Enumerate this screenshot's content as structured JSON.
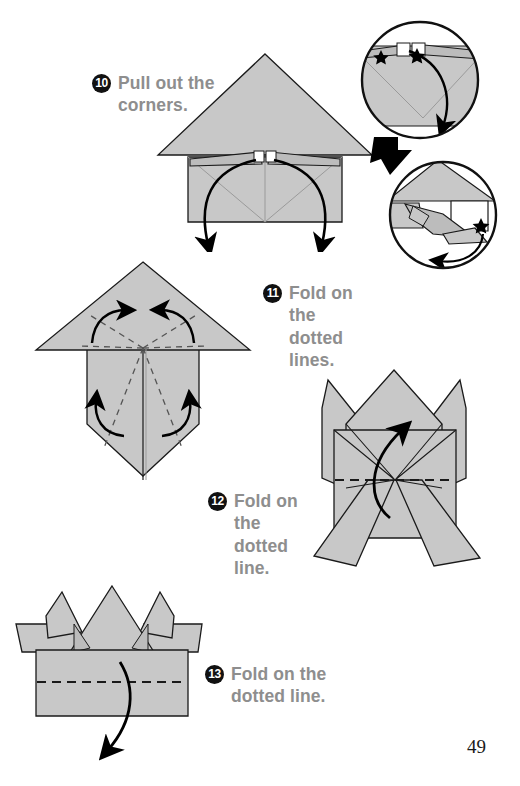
{
  "page": {
    "number": "49",
    "background_color": "#ffffff",
    "paper_fill": "#c8c8c8",
    "paper_fill_shade": "#bcbcbc",
    "outline_color": "#1a1a1a",
    "text_color": "#8e8e8e",
    "badge_color": "#111111",
    "arrow_color": "#000000"
  },
  "steps": [
    {
      "number": "10",
      "text": "Pull out the\ncorners.",
      "diagram": "triangle-roof-over-rectangle-with-two-pull-arrows",
      "detail_callouts": 2
    },
    {
      "number": "11",
      "text": "Fold on\nthe dotted\nlines.",
      "diagram": "triangle-over-pentagon-with-four-dashed-fold-lines",
      "dashed_lines": 4,
      "arrows": 4
    },
    {
      "number": "12",
      "text": "Fold on\nthe dotted\nline.",
      "diagram": "crown-shape-with-horizontal-dashed-line",
      "dashed_lines": 1,
      "arrows": 1
    },
    {
      "number": "13",
      "text": "Fold on the\ndotted line.",
      "diagram": "box-with-crown-points-and-horizontal-dashed-line",
      "dashed_lines": 1,
      "arrows": 1
    }
  ],
  "detail_circles": [
    {
      "name": "close-up-before-pull",
      "markers": "two-star-markers",
      "arrow": "curved-arrow-down-right"
    },
    {
      "name": "close-up-after-pull",
      "markers": "one-star-marker",
      "arrow": "curved-arrow-left"
    }
  ],
  "transition_arrow": {
    "name": "thick-black-transition-arrow",
    "direction": "down-right"
  }
}
